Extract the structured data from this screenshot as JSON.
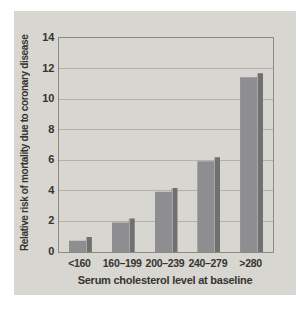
{
  "chart_data": {
    "type": "bar",
    "categories": [
      "<160",
      "160–199",
      "200–239",
      "240–279",
      ">280"
    ],
    "values": [
      1.0,
      2.2,
      4.2,
      6.2,
      11.7
    ],
    "title": "",
    "xlabel": "Serum cholesterol level at baseline",
    "ylabel": "Relative risk of mortality due to coronary disease",
    "ylim": [
      0,
      14
    ],
    "yticks": [
      0,
      2,
      4,
      6,
      8,
      10,
      12,
      14
    ],
    "grid": true,
    "legend": false
  },
  "colors": {
    "page_background": "#ffffff",
    "panel_background": "#d7d6d1",
    "bar_face": "#8e8e91",
    "bar_highlight": "#a7a7a9",
    "bar_side": "#707073",
    "gridline": "#b2b1aa",
    "plot_border": "#8b8a83",
    "text": "#35342f"
  }
}
